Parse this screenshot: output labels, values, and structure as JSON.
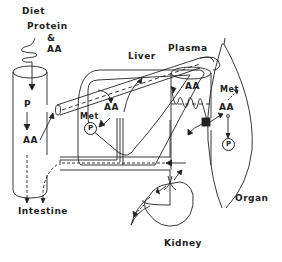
{
  "diagram": {
    "labels": {
      "diet": "Diet",
      "protein": "Protein",
      "ampersand": "&",
      "aa_diet": "AA",
      "liver": "Liver",
      "plasma": "Plasma",
      "intestine_p": "P",
      "intestine_aa": "AA",
      "intestine": "Intestine",
      "liver_aa": "AA",
      "liver_met": "Met",
      "liver_p": "P",
      "plasma_aa": "AA",
      "organ_met": "Met",
      "organ_aa": "AA",
      "organ_p": "P",
      "organ": "Organ",
      "kidney": "Kidney"
    },
    "colors": {
      "line": "#222222",
      "background": "#ffffff"
    }
  }
}
